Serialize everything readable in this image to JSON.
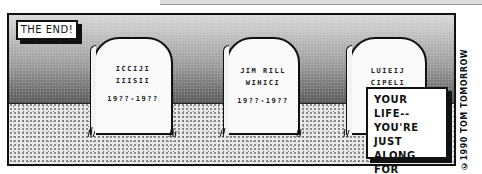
{
  "comic": {
    "captions": {
      "top_left": "THE END!",
      "bottom_right": [
        "YOUR LIFE--",
        "YOU'RE JUST",
        "ALONG FOR",
        "THE RIDE!"
      ]
    },
    "credit": "©1990 TOM TOMORROW",
    "tombstones": [
      {
        "lines": [
          "ICCIJI",
          "IIISII",
          "19??-19??"
        ]
      },
      {
        "lines": [
          "JIM RILL",
          "WIHICI",
          "19??-19??"
        ]
      },
      {
        "lines": [
          "LUIEIJ",
          "CIPELI",
          ""
        ]
      }
    ],
    "colors": {
      "ink": "#111111",
      "paper": "#ffffff",
      "sky_top": "#d8d8d8",
      "sky_bottom": "#2a2a2a",
      "ground": "#e9e9e9"
    }
  }
}
